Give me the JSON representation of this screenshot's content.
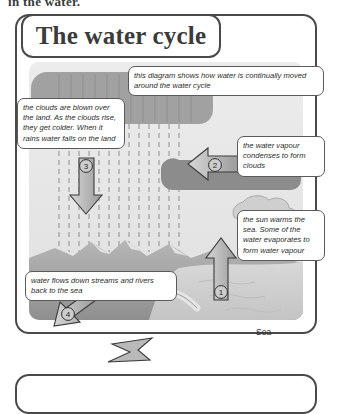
{
  "page": {
    "clipped_top_text": "in the water.",
    "title": "The water cycle",
    "sea_label": "Sea"
  },
  "notes": {
    "intro": "this diagram shows how water is continually moved around the water cycle",
    "clouds": "the clouds are blown over the land. As the clouds rise, they get colder. When it rains water falls on the land",
    "condense": "the water vapour condenses to form clouds",
    "sun": "the sun warms the sea. Some of the water evaporates to form water vapour",
    "rivers": "water flows down streams and rivers back to the sea"
  },
  "arrows": [
    {
      "id": "1",
      "label": "1",
      "direction": "up",
      "meaning": "evaporation-from-sea"
    },
    {
      "id": "2",
      "label": "2",
      "direction": "left",
      "meaning": "vapour-moves-to-clouds"
    },
    {
      "id": "3",
      "label": "3",
      "direction": "down",
      "meaning": "rain-falls-on-land"
    },
    {
      "id": "4",
      "label": "4",
      "direction": "down-left",
      "meaning": "runoff-to-sea"
    }
  ],
  "colors": {
    "frame": "#4a4a4a",
    "title_text": "#3b3b3b",
    "note_border": "#5a5a5a",
    "note_text": "#2c2c2c",
    "sky": "#e9e9e9",
    "land": "#9d9d9d",
    "sea": "#cfcfcf",
    "arrow_fill": "#b4b4b4",
    "arrow_stroke": "#3c3c3c"
  }
}
